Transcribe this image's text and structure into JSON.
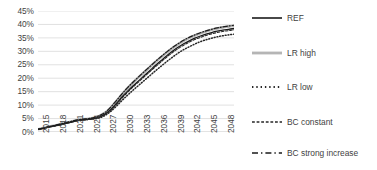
{
  "chart_data": {
    "type": "line",
    "title": "",
    "xlabel": "",
    "ylabel": "",
    "ylim": [
      0,
      45
    ],
    "xlim": [
      2015,
      2050
    ],
    "grid": true,
    "legend_position": "right",
    "y_ticks": [
      "0%",
      "5%",
      "10%",
      "15%",
      "20%",
      "25%",
      "30%",
      "35%",
      "40%",
      "45%"
    ],
    "y_tick_values": [
      0,
      5,
      10,
      15,
      20,
      25,
      30,
      35,
      40,
      45
    ],
    "x_ticks": [
      "2015",
      "2018",
      "2021",
      "2024",
      "2027",
      "2030",
      "2033",
      "2036",
      "2039",
      "2042",
      "2045",
      "2048"
    ],
    "x_tick_values": [
      2015,
      2018,
      2021,
      2024,
      2027,
      2030,
      2033,
      2036,
      2039,
      2042,
      2045,
      2048
    ],
    "x": [
      2015,
      2016,
      2017,
      2018,
      2019,
      2020,
      2021,
      2022,
      2023,
      2024,
      2025,
      2026,
      2027,
      2028,
      2029,
      2030,
      2031,
      2032,
      2033,
      2034,
      2035,
      2036,
      2037,
      2038,
      2039,
      2040,
      2041,
      2042,
      2043,
      2044,
      2045,
      2046,
      2047,
      2048,
      2049,
      2050
    ],
    "series": [
      {
        "name": "REF",
        "style": "solid",
        "color": "#1a1a1a",
        "width": 1.3,
        "values": [
          1.0,
          1.4,
          1.9,
          2.3,
          2.7,
          3.2,
          3.7,
          4.2,
          4.5,
          4.7,
          5.0,
          5.6,
          6.7,
          8.4,
          10.6,
          13.0,
          15.2,
          17.2,
          19.1,
          21.0,
          22.9,
          24.8,
          26.6,
          28.4,
          30.0,
          31.5,
          32.8,
          33.9,
          34.9,
          35.7,
          36.4,
          37.0,
          37.5,
          37.9,
          38.2,
          38.5
        ]
      },
      {
        "name": "LR high",
        "style": "solid",
        "color": "#b5b5b5",
        "width": 2.6,
        "values": [
          1.0,
          1.5,
          2.0,
          2.4,
          2.9,
          3.4,
          3.9,
          4.4,
          4.7,
          4.9,
          5.3,
          6.0,
          7.2,
          9.1,
          11.5,
          14.0,
          16.3,
          18.4,
          20.4,
          22.3,
          24.2,
          26.1,
          27.9,
          29.6,
          31.2,
          32.6,
          33.9,
          35.0,
          35.9,
          36.7,
          37.4,
          38.0,
          38.5,
          38.9,
          39.2,
          39.5
        ]
      },
      {
        "name": "LR low",
        "style": "dotted",
        "color": "#262626",
        "width": 1.5,
        "values": [
          1.0,
          1.4,
          1.9,
          2.3,
          2.8,
          3.3,
          3.8,
          4.3,
          4.6,
          4.7,
          4.9,
          5.3,
          6.2,
          7.7,
          9.6,
          11.7,
          13.7,
          15.6,
          17.4,
          19.2,
          21.0,
          22.8,
          24.5,
          26.2,
          27.8,
          29.3,
          30.6,
          31.7,
          32.7,
          33.6,
          34.3,
          34.9,
          35.4,
          35.8,
          36.1,
          36.4
        ]
      },
      {
        "name": "BC constant",
        "style": "dashed",
        "color": "#262626",
        "width": 1.1,
        "values": [
          1.0,
          1.4,
          1.9,
          2.3,
          2.7,
          3.2,
          3.7,
          4.2,
          4.5,
          4.7,
          5.0,
          5.5,
          6.6,
          8.2,
          10.3,
          12.6,
          14.8,
          16.8,
          18.7,
          20.6,
          22.5,
          24.3,
          26.1,
          27.9,
          29.5,
          31.0,
          32.3,
          33.4,
          34.4,
          35.2,
          35.9,
          36.5,
          37.0,
          37.4,
          37.7,
          38.0
        ]
      },
      {
        "name": "BC strong increase",
        "style": "dashdot",
        "color": "#1a1a1a",
        "width": 1.2,
        "values": [
          1.0,
          1.5,
          2.0,
          2.5,
          3.0,
          3.5,
          4.0,
          4.5,
          4.8,
          5.0,
          5.4,
          6.1,
          7.3,
          9.3,
          11.7,
          14.2,
          16.5,
          18.6,
          20.6,
          22.5,
          24.4,
          26.3,
          28.1,
          29.8,
          31.4,
          32.8,
          34.1,
          35.2,
          36.1,
          36.9,
          37.6,
          38.2,
          38.7,
          39.1,
          39.4,
          39.7
        ]
      }
    ]
  },
  "legend": {
    "items": [
      {
        "label": "REF",
        "style": "solid",
        "color": "#1a1a1a",
        "width": 1.6
      },
      {
        "label": "LR high",
        "style": "solid",
        "color": "#b5b5b5",
        "width": 2.8
      },
      {
        "label": "LR low",
        "style": "dotted",
        "color": "#262626",
        "width": 1.8
      },
      {
        "label": "BC constant",
        "style": "dashed",
        "color": "#262626",
        "width": 1.4
      },
      {
        "label": "BC strong increase",
        "style": "dashdot",
        "color": "#1a1a1a",
        "width": 1.5
      }
    ]
  },
  "style": {
    "gridline_color": "#d9d9d9",
    "text_color": "#3f3f3f",
    "background": "#ffffff"
  }
}
